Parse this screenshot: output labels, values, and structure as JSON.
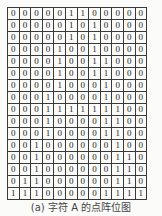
{
  "figure": {
    "title": "字符 A 的点阵位图",
    "caption": "(a) 字符 A 的点阵位图",
    "rows": 16,
    "cols": 12,
    "bitmap": [
      [
        0,
        0,
        0,
        0,
        0,
        1,
        1,
        0,
        0,
        0,
        0,
        0
      ],
      [
        0,
        0,
        0,
        0,
        0,
        1,
        0,
        1,
        0,
        0,
        0,
        0
      ],
      [
        0,
        0,
        0,
        0,
        0,
        1,
        0,
        1,
        0,
        0,
        0,
        0
      ],
      [
        0,
        0,
        0,
        0,
        1,
        0,
        0,
        1,
        0,
        0,
        0,
        0
      ],
      [
        0,
        0,
        0,
        0,
        1,
        0,
        0,
        1,
        1,
        0,
        0,
        0
      ],
      [
        0,
        0,
        0,
        0,
        1,
        0,
        0,
        1,
        1,
        0,
        0,
        0
      ],
      [
        0,
        0,
        0,
        0,
        1,
        0,
        0,
        0,
        1,
        0,
        0,
        0
      ],
      [
        0,
        0,
        0,
        1,
        0,
        0,
        0,
        0,
        1,
        0,
        0,
        0
      ],
      [
        0,
        0,
        0,
        1,
        1,
        1,
        1,
        1,
        1,
        1,
        0,
        0
      ],
      [
        0,
        0,
        0,
        1,
        0,
        0,
        0,
        0,
        1,
        1,
        0,
        0
      ],
      [
        0,
        0,
        0,
        1,
        0,
        0,
        0,
        0,
        1,
        1,
        0,
        0
      ],
      [
        0,
        0,
        1,
        0,
        0,
        0,
        0,
        0,
        0,
        1,
        0,
        0
      ],
      [
        0,
        0,
        1,
        0,
        0,
        0,
        0,
        0,
        0,
        1,
        1,
        0
      ],
      [
        0,
        0,
        1,
        0,
        0,
        0,
        0,
        0,
        0,
        1,
        1,
        0
      ],
      [
        0,
        1,
        1,
        0,
        0,
        0,
        0,
        0,
        0,
        1,
        1,
        0
      ],
      [
        1,
        1,
        1,
        0,
        0,
        0,
        0,
        0,
        1,
        1,
        1,
        1
      ]
    ]
  },
  "colors": {
    "background": "#fbfbfa",
    "grid_line": "#3a3a3a",
    "text": "#222222",
    "caption": "#444444"
  }
}
